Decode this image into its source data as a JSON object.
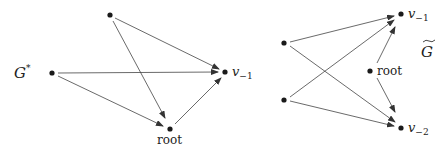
{
  "diagrams": [
    {
      "name": "G*",
      "label": "G",
      "label_sup": "*",
      "nodes": [
        {
          "id": "a",
          "x": 110,
          "y": 15,
          "label": ""
        },
        {
          "id": "g",
          "x": 52,
          "y": 73,
          "label": ""
        },
        {
          "id": "v-1",
          "x": 225,
          "y": 72,
          "label": "v",
          "sub": "−1"
        },
        {
          "id": "root",
          "x": 170,
          "y": 129,
          "label": "root"
        }
      ],
      "edges": [
        [
          "a",
          "v-1"
        ],
        [
          "a",
          "root"
        ],
        [
          "g",
          "v-1"
        ],
        [
          "g",
          "root"
        ],
        [
          "root",
          "v-1"
        ]
      ]
    },
    {
      "name": "G-tilde",
      "label": "G",
      "label_accent": "~",
      "nodes": [
        {
          "id": "n1",
          "x": 284,
          "y": 43,
          "label": ""
        },
        {
          "id": "n2",
          "x": 284,
          "y": 100,
          "label": ""
        },
        {
          "id": "v-1",
          "x": 401,
          "y": 14,
          "label": "v",
          "sub": "−1"
        },
        {
          "id": "root",
          "x": 370,
          "y": 71,
          "label": "root"
        },
        {
          "id": "v-2",
          "x": 401,
          "y": 128,
          "label": "v",
          "sub": "−2"
        }
      ],
      "edges": [
        [
          "n1",
          "v-1"
        ],
        [
          "n1",
          "v-2"
        ],
        [
          "n2",
          "v-1"
        ],
        [
          "n2",
          "v-2"
        ],
        [
          "root",
          "v-1"
        ],
        [
          "root",
          "v-2"
        ]
      ]
    }
  ],
  "labels": {
    "left_graph": "G",
    "left_sup": "*",
    "right_graph": "G",
    "v_minus_1": "v",
    "sub_minus_1": "−1",
    "v_minus_2": "v",
    "sub_minus_2": "−2",
    "root": "root"
  },
  "colors": {
    "stroke": "#333333",
    "node": "#1a1a1a"
  }
}
